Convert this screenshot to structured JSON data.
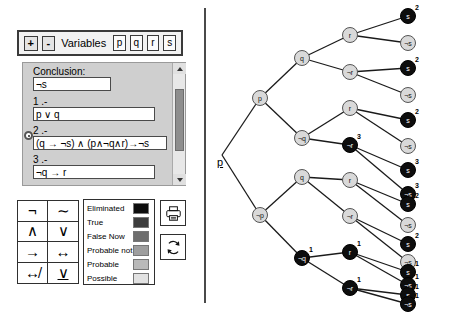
{
  "toolbar": {
    "add_label": "+",
    "remove_label": "-",
    "variables_label": "Variables",
    "variables": [
      "p",
      "q",
      "r",
      "s"
    ]
  },
  "premises_panel": {
    "conclusion_label": "Conclusion:",
    "conclusion_value": "¬s",
    "lines": [
      {
        "number": "1 .-",
        "value": "p ∨ q",
        "selected": false
      },
      {
        "number": "2 .-",
        "value": "(q → ¬s) ∧ (p∧¬q∧r)→¬s",
        "selected": true
      },
      {
        "number": "3 .-",
        "value": "¬q → r",
        "selected": false
      }
    ],
    "scrollbar": {
      "up_icon": "triangle-up-icon",
      "down_icon": "triangle-down-icon"
    }
  },
  "operators": [
    {
      "glyph": "¬",
      "name": "not"
    },
    {
      "glyph": "∼",
      "name": "tilde-not"
    },
    {
      "glyph": "∧",
      "name": "and"
    },
    {
      "glyph": "∨",
      "name": "or"
    },
    {
      "glyph": "→",
      "name": "implies"
    },
    {
      "glyph": "↔",
      "name": "biconditional"
    },
    {
      "glyph": "↮",
      "name": "not-biconditional"
    },
    {
      "glyph": "∨",
      "name": "exclusive-or"
    }
  ],
  "legend": {
    "entries": [
      {
        "label": "Eliminated",
        "color": "#0d0d0d"
      },
      {
        "label": "True",
        "color": "#3d3d3d"
      },
      {
        "label": "False Now",
        "color": "#6e6e6e"
      },
      {
        "label": "Probable not",
        "color": "#9e9e9e"
      },
      {
        "label": "Probable",
        "color": "#b9b9b9"
      },
      {
        "label": "Possible",
        "color": "#e2e2e2"
      }
    ]
  },
  "actions": {
    "print_icon": "printer-icon",
    "refresh_icon": "refresh-icon"
  },
  "chart_data": {
    "type": "tree",
    "title": "",
    "root_label": "p",
    "nodes": [
      {
        "id": "p",
        "label": "p",
        "x": 50,
        "y": 98,
        "state": "light",
        "sup": ""
      },
      {
        "id": "np",
        "label": "¬p",
        "x": 50,
        "y": 215,
        "state": "light",
        "sup": ""
      },
      {
        "id": "p-q",
        "label": "q",
        "x": 92,
        "y": 58,
        "state": "light",
        "sup": ""
      },
      {
        "id": "p-nq",
        "label": "¬q",
        "x": 92,
        "y": 138,
        "state": "light",
        "sup": ""
      },
      {
        "id": "np-q",
        "label": "q",
        "x": 92,
        "y": 177,
        "state": "light",
        "sup": ""
      },
      {
        "id": "np-nq",
        "label": "¬q",
        "x": 92,
        "y": 258,
        "state": "dark",
        "sup": "1"
      },
      {
        "id": "n1",
        "label": "r",
        "x": 140,
        "y": 35,
        "state": "light",
        "sup": ""
      },
      {
        "id": "n2",
        "label": "¬r",
        "x": 140,
        "y": 72,
        "state": "light",
        "sup": ""
      },
      {
        "id": "n3",
        "label": "r",
        "x": 140,
        "y": 108,
        "state": "light",
        "sup": ""
      },
      {
        "id": "n4",
        "label": "¬r",
        "x": 140,
        "y": 145,
        "state": "dark",
        "sup": "3"
      },
      {
        "id": "n5",
        "label": "r",
        "x": 140,
        "y": 180,
        "state": "light",
        "sup": ""
      },
      {
        "id": "n6",
        "label": "¬r",
        "x": 140,
        "y": 216,
        "state": "light",
        "sup": ""
      },
      {
        "id": "n7",
        "label": "r",
        "x": 140,
        "y": 252,
        "state": "dark",
        "sup": "1"
      },
      {
        "id": "n8",
        "label": "¬r",
        "x": 140,
        "y": 288,
        "state": "dark",
        "sup": "1"
      },
      {
        "id": "l1",
        "label": "s",
        "x": 198,
        "y": 16,
        "state": "dark",
        "sup": "2"
      },
      {
        "id": "l2",
        "label": "¬s",
        "x": 198,
        "y": 43,
        "state": "light",
        "sup": ""
      },
      {
        "id": "l3",
        "label": "s",
        "x": 198,
        "y": 68,
        "state": "dark",
        "sup": "2"
      },
      {
        "id": "l4",
        "label": "¬s",
        "x": 198,
        "y": 95,
        "state": "light",
        "sup": ""
      },
      {
        "id": "l5",
        "label": "s",
        "x": 198,
        "y": 120,
        "state": "dark",
        "sup": "2"
      },
      {
        "id": "l6",
        "label": "¬s",
        "x": 198,
        "y": 146,
        "state": "light",
        "sup": ""
      },
      {
        "id": "l7",
        "label": "s",
        "x": 198,
        "y": 170,
        "state": "dark",
        "sup": "3"
      },
      {
        "id": "l8",
        "label": "¬s",
        "x": 198,
        "y": 194,
        "state": "dark",
        "sup": "3"
      },
      {
        "id": "l9",
        "label": "s",
        "x": 198,
        "y": 204,
        "state": "dark",
        "sup": "2"
      },
      {
        "id": "l10",
        "label": "¬s",
        "x": 198,
        "y": 225,
        "state": "light",
        "sup": ""
      },
      {
        "id": "l11",
        "label": "s",
        "x": 198,
        "y": 244,
        "state": "dark",
        "sup": "2"
      },
      {
        "id": "l12",
        "label": "¬s",
        "x": 198,
        "y": 262,
        "state": "light",
        "sup": ""
      },
      {
        "id": "l13",
        "label": "s",
        "x": 198,
        "y": 272,
        "state": "dark",
        "sup": "1"
      },
      {
        "id": "l14",
        "label": "¬s",
        "x": 198,
        "y": 285,
        "state": "dark",
        "sup": "1"
      },
      {
        "id": "l15",
        "label": "s",
        "x": 198,
        "y": 295,
        "state": "dark",
        "sup": "1"
      },
      {
        "id": "l16",
        "label": "¬s",
        "x": 198,
        "y": 304,
        "state": "dark",
        "sup": "1"
      }
    ],
    "edges": [
      [
        "origin",
        "p"
      ],
      [
        "origin",
        "np"
      ],
      [
        "p",
        "p-q"
      ],
      [
        "p",
        "p-nq"
      ],
      [
        "np",
        "np-q"
      ],
      [
        "np",
        "np-nq"
      ],
      [
        "p-q",
        "n1"
      ],
      [
        "p-q",
        "n2"
      ],
      [
        "p-nq",
        "n3"
      ],
      [
        "p-nq",
        "n4"
      ],
      [
        "np-q",
        "n5"
      ],
      [
        "np-q",
        "n6"
      ],
      [
        "np-nq",
        "n7"
      ],
      [
        "np-nq",
        "n8"
      ],
      [
        "n1",
        "l1"
      ],
      [
        "n1",
        "l2"
      ],
      [
        "n2",
        "l3"
      ],
      [
        "n2",
        "l4"
      ],
      [
        "n3",
        "l5"
      ],
      [
        "n3",
        "l6"
      ],
      [
        "n4",
        "l7"
      ],
      [
        "n4",
        "l8"
      ],
      [
        "n5",
        "l9"
      ],
      [
        "n5",
        "l10"
      ],
      [
        "n6",
        "l11"
      ],
      [
        "n6",
        "l12"
      ],
      [
        "n7",
        "l13"
      ],
      [
        "n7",
        "l14"
      ],
      [
        "n8",
        "l15"
      ],
      [
        "n8",
        "l16"
      ]
    ],
    "origin": {
      "x": 12,
      "y": 155
    }
  }
}
